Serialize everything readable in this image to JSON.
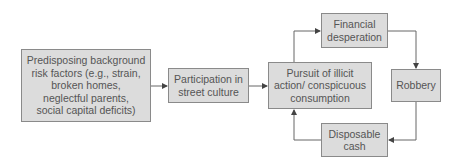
{
  "diagram": {
    "nodes": [
      {
        "id": "risk-factors",
        "label": "Predisposing background\nrisk factors (e.g., strain,\nbroken homes,\nneglectful parents,\nsocial capital deficits)"
      },
      {
        "id": "street-culture",
        "label": "Participation in\nstreet culture"
      },
      {
        "id": "illicit-action",
        "label": "Pursuit of illicit\naction/ conspicuous\nconsumption"
      },
      {
        "id": "financial-desperation",
        "label": "Financial\ndesperation"
      },
      {
        "id": "robbery",
        "label": "Robbery"
      },
      {
        "id": "disposable-cash",
        "label": "Disposable\ncash"
      }
    ],
    "edges": [
      {
        "from": "risk-factors",
        "to": "street-culture"
      },
      {
        "from": "street-culture",
        "to": "illicit-action"
      },
      {
        "from": "illicit-action",
        "to": "financial-desperation"
      },
      {
        "from": "financial-desperation",
        "to": "robbery"
      },
      {
        "from": "robbery",
        "to": "disposable-cash"
      },
      {
        "from": "disposable-cash",
        "to": "illicit-action"
      }
    ],
    "colors": {
      "fill": "#dcdcdc",
      "border": "#8a8a8a",
      "text": "#555555",
      "line": "#666666"
    }
  }
}
